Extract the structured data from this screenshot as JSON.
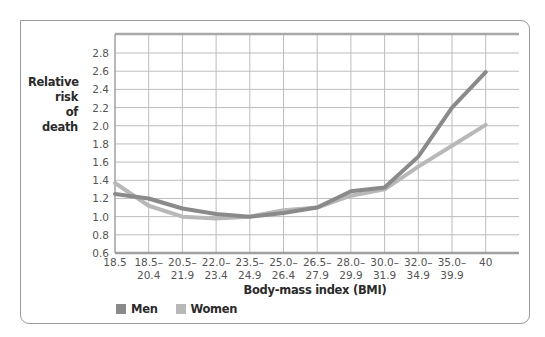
{
  "chart_data": {
    "type": "line",
    "title": "",
    "ylabel": "Relative risk of death",
    "xlabel": "Body-mass index (BMI)",
    "ylim": [
      0.6,
      2.9
    ],
    "yticks": [
      0.6,
      0.8,
      1.0,
      1.2,
      1.4,
      1.6,
      1.8,
      2.0,
      2.2,
      2.4,
      2.6,
      2.8
    ],
    "ytick_labels": [
      "0.6",
      "0.8",
      "1.0",
      "1.2",
      "1.4",
      "1.6",
      "1.8",
      "2.0",
      "2.2",
      "2.4",
      "2.6",
      "2.8"
    ],
    "categories": [
      "18.5",
      "18.5–20.4",
      "20.5–21.9",
      "22.0–23.4",
      "23.5–24.9",
      "25.0–26.4",
      "26.5–27.9",
      "28.0–29.9",
      "30.0–31.9",
      "32.0–34.9",
      "35.0–39.9",
      "40"
    ],
    "xtick_lines": [
      [
        "18.5",
        ""
      ],
      [
        "18.5–",
        "20.4"
      ],
      [
        "20.5–",
        "21.9"
      ],
      [
        "22.0–",
        "23.4"
      ],
      [
        "23.5–",
        "24.9"
      ],
      [
        "25.0–",
        "26.4"
      ],
      [
        "26.5–",
        "27.9"
      ],
      [
        "28.0–",
        "29.9"
      ],
      [
        "30.0–",
        "31.9"
      ],
      [
        "32.0–",
        "34.9"
      ],
      [
        "35.0–",
        "39.9"
      ],
      [
        "40",
        ""
      ]
    ],
    "series": [
      {
        "name": "Men",
        "color": "#8a8a8a",
        "values": [
          1.25,
          1.2,
          1.09,
          1.03,
          1.0,
          1.04,
          1.1,
          1.28,
          1.32,
          1.66,
          2.2,
          2.59
        ]
      },
      {
        "name": "Women",
        "color": "#b8b8b8",
        "values": [
          1.37,
          1.12,
          1.0,
          0.98,
          1.0,
          1.07,
          1.1,
          1.23,
          1.3,
          1.55,
          1.78,
          2.01
        ]
      }
    ],
    "grid": true,
    "legend_position": "bottom-left"
  },
  "labels": {
    "y_line1": "Relative risk",
    "y_line2": "of death",
    "x": "Body-mass index (BMI)"
  },
  "legend": [
    {
      "label": "Men",
      "color": "#8a8a8a"
    },
    {
      "label": "Women",
      "color": "#b8b8b8"
    }
  ]
}
